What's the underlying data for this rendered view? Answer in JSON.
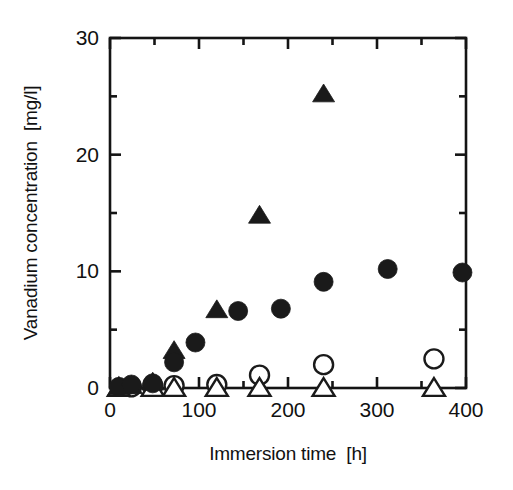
{
  "chart_data": {
    "type": "scatter",
    "title": "",
    "xlabel": "Immersion time  [h]",
    "ylabel": "Vanadium concentration  [mg/l]",
    "xlim": [
      0,
      400
    ],
    "ylim": [
      0,
      30
    ],
    "xticks": [
      0,
      100,
      200,
      300,
      400
    ],
    "xticklabels": [
      "0",
      "100",
      "200",
      "300",
      "400"
    ],
    "xminorticks": [
      50,
      150,
      250,
      350
    ],
    "yticks": [
      0,
      10,
      20,
      30
    ],
    "yticklabels": [
      "0",
      "10",
      "20",
      "30"
    ],
    "yminorticks": [
      5,
      15,
      25
    ],
    "grid": false,
    "legend": "none",
    "frame": "box",
    "series": [
      {
        "name": "filled-triangle",
        "marker": "triangle",
        "fill": "solid",
        "color": "#1a1a1a",
        "points": [
          {
            "x": 10,
            "y": 0.1
          },
          {
            "x": 24,
            "y": 0.2
          },
          {
            "x": 48,
            "y": 0.5
          },
          {
            "x": 72,
            "y": 3.2
          },
          {
            "x": 120,
            "y": 6.7
          },
          {
            "x": 168,
            "y": 14.8
          },
          {
            "x": 240,
            "y": 25.2
          }
        ]
      },
      {
        "name": "filled-circle",
        "marker": "circle",
        "fill": "solid",
        "color": "#1a1a1a",
        "points": [
          {
            "x": 10,
            "y": 0.1
          },
          {
            "x": 24,
            "y": 0.3
          },
          {
            "x": 48,
            "y": 0.4
          },
          {
            "x": 72,
            "y": 2.2
          },
          {
            "x": 96,
            "y": 3.9
          },
          {
            "x": 144,
            "y": 6.6
          },
          {
            "x": 192,
            "y": 6.8
          },
          {
            "x": 240,
            "y": 9.1
          },
          {
            "x": 312,
            "y": 10.2
          },
          {
            "x": 396,
            "y": 9.9
          }
        ]
      },
      {
        "name": "open-circle",
        "marker": "circle",
        "fill": "open",
        "color": "#1a1a1a",
        "points": [
          {
            "x": 24,
            "y": 0.1
          },
          {
            "x": 48,
            "y": 0.2
          },
          {
            "x": 72,
            "y": 0.2
          },
          {
            "x": 120,
            "y": 0.3
          },
          {
            "x": 168,
            "y": 1.1
          },
          {
            "x": 240,
            "y": 2.0
          },
          {
            "x": 364,
            "y": 2.5
          }
        ]
      },
      {
        "name": "open-triangle",
        "marker": "triangle",
        "fill": "open",
        "color": "#1a1a1a",
        "points": [
          {
            "x": 10,
            "y": 0.0
          },
          {
            "x": 48,
            "y": 0.0
          },
          {
            "x": 72,
            "y": 0.0
          },
          {
            "x": 120,
            "y": 0.0
          },
          {
            "x": 168,
            "y": 0.0
          },
          {
            "x": 240,
            "y": 0.0
          },
          {
            "x": 364,
            "y": 0.0
          }
        ]
      }
    ]
  }
}
